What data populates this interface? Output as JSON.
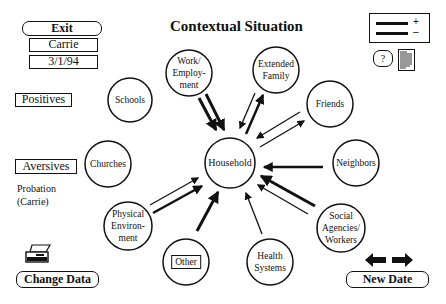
{
  "title": "Contextual Situation",
  "left_panel": {
    "exit_label": "Exit",
    "client_name": "Carrie",
    "date": "3/1/94",
    "positives_label": "Positives",
    "aversives_label": "Aversives",
    "aversive_items": [
      "Probation",
      "(Carrie)"
    ],
    "change_data_label": "Change Data"
  },
  "right_panel": {
    "legend_plus": "+",
    "legend_minus": "–",
    "help_label": "?",
    "new_date_label": "New Date"
  },
  "nodes": {
    "household": "Household",
    "work": "Work/\nEmploy-\nment",
    "extended_family": "Extended\nFamily",
    "friends": "Friends",
    "schools": "Schools",
    "churches": "Churches",
    "neighbors": "Neighbors",
    "physical_environment": "Physical\nEnviron-\nment",
    "other": "Other",
    "health_systems": "Health\nSystems",
    "social_agencies": "Social\nAgencies/\nWorkers"
  }
}
